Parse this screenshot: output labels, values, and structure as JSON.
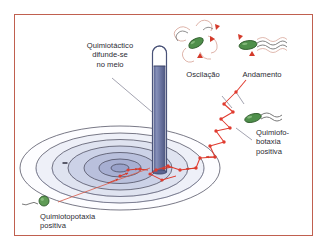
{
  "figure": {
    "border_color": "#c0604f",
    "background_color": "#ffffff"
  },
  "labels": {
    "capillary": {
      "line1": "Quimiotáctico",
      "line2": "difunde-se",
      "line3": "no meio"
    },
    "oscillation": "Oscilação",
    "run": "Andamento",
    "phobotaxis": {
      "line1": "Quimiofo-",
      "line2": "botaxia",
      "line3": "positiva"
    },
    "topotaxis": {
      "line1": "Quimiotopotaxia",
      "line2": "positiva"
    }
  },
  "colors": {
    "border": "#c0604f",
    "capillary_fill": "#6f7aa8",
    "capillary_outline": "#4a5378",
    "gradient_outer": "#ffffff",
    "gradient_mid": "#cdd3e6",
    "gradient_inner": "#a9b2d2",
    "ring_outline": "#3a3a4e",
    "bacterium_body": "#4e8f4a",
    "bacterium_outline": "#2f5c2c",
    "path_red": "#e03b2f",
    "arrow_red": "#d43a2a",
    "flagellum": "#6b6b6b",
    "leader_line": "#7b7b8c",
    "text": "#2b2b33"
  },
  "elements": {
    "capillary_tube": "capillary-tube",
    "diffusion_gradient": "concentric-gradient-rings",
    "random_walk_path": "red-zigzag-run-tumble-path",
    "bacteria_icons": [
      "tumbling-bacterium",
      "swimming-bacterium",
      "gradient-bacterium",
      "approaching-bacterium"
    ]
  }
}
